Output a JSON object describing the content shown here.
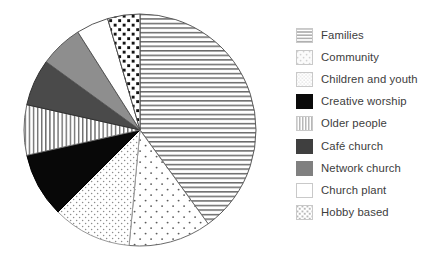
{
  "chart_data": {
    "type": "pie",
    "title": "",
    "subtitle": "",
    "xlabel": "",
    "ylabel": "",
    "legend_position": "right",
    "grid": false,
    "start_angle_deg": 0,
    "direction": "clockwise",
    "center": {
      "x": 140,
      "y": 130
    },
    "radius": 116,
    "categories": [
      "Families",
      "Community",
      "Children and youth",
      "Creative worship",
      "Older people",
      "Café church",
      "Network church",
      "Church plant",
      "Hobby based"
    ],
    "values": [
      40,
      11.5,
      11,
      9,
      7,
      6.5,
      6,
      4.5,
      4.5
    ],
    "slices": [
      {
        "label": "Families",
        "value": 40,
        "start_deg": 0,
        "end_deg": 144,
        "pattern": "horizontal-lines",
        "fill": "#ffffff",
        "stroke": "#5a5a5a"
      },
      {
        "label": "Community",
        "value": 11.5,
        "start_deg": 144,
        "end_deg": 185.4,
        "pattern": "sparse-dots",
        "fill": "#ffffff",
        "stroke": "#6b6b6b"
      },
      {
        "label": "Children and youth",
        "value": 11,
        "start_deg": 185.4,
        "end_deg": 225,
        "pattern": "fine-dense-dots",
        "fill": "#ffffff",
        "stroke": "#9a9a9a"
      },
      {
        "label": "Creative worship",
        "value": 9,
        "start_deg": 225,
        "end_deg": 257.4,
        "pattern": "solid",
        "fill": "#080808",
        "stroke": "#000000"
      },
      {
        "label": "Older people",
        "value": 7,
        "start_deg": 257.4,
        "end_deg": 282.6,
        "pattern": "vertical-lines",
        "fill": "#ffffff",
        "stroke": "#6e6e6e"
      },
      {
        "label": "Café church",
        "value": 6.5,
        "start_deg": 282.6,
        "end_deg": 306,
        "pattern": "solid",
        "fill": "#4a4a4a",
        "stroke": "#303030"
      },
      {
        "label": "Network church",
        "value": 6,
        "start_deg": 306,
        "end_deg": 327.6,
        "pattern": "solid",
        "fill": "#8e8e8e",
        "stroke": "#5a5a5a"
      },
      {
        "label": "Church plant",
        "value": 4.5,
        "start_deg": 327.6,
        "end_deg": 343.8,
        "pattern": "none",
        "fill": "#ffffff",
        "stroke": "#555555"
      },
      {
        "label": "Hobby based",
        "value": 4.5,
        "start_deg": 343.8,
        "end_deg": 360,
        "pattern": "bold-square-dots",
        "fill": "#ffffff",
        "stroke": "#4a4a4a"
      }
    ]
  },
  "legend": {
    "items": [
      {
        "label": "Families",
        "pattern": "horizontal-lines",
        "swatch_color": "#b5b5b5"
      },
      {
        "label": "Community",
        "pattern": "sparse-dots",
        "swatch_color": "#d8d8d8"
      },
      {
        "label": "Children and youth",
        "pattern": "fine-dense-dots",
        "swatch_color": "#cfcfcf"
      },
      {
        "label": "Creative worship",
        "pattern": "solid",
        "swatch_color": "#0a0a0a"
      },
      {
        "label": "Older people",
        "pattern": "vertical-lines",
        "swatch_color": "#bdbdbd"
      },
      {
        "label": "Café church",
        "pattern": "solid",
        "swatch_color": "#3f3f3f"
      },
      {
        "label": "Network church",
        "pattern": "solid",
        "swatch_color": "#808080"
      },
      {
        "label": "Church plant",
        "pattern": "none",
        "swatch_color": "#ffffff"
      },
      {
        "label": "Hobby based",
        "pattern": "bold-square-dots",
        "swatch_color": "#c8c8c8"
      }
    ]
  }
}
